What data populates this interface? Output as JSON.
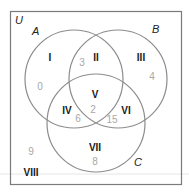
{
  "diagram": {
    "type": "venn-3-set",
    "universe_label": "U",
    "sets": [
      {
        "label": "A"
      },
      {
        "label": "B"
      },
      {
        "label": "C"
      }
    ],
    "regions": [
      {
        "id": "I",
        "label": "I",
        "count": "0"
      },
      {
        "id": "II",
        "label": "II",
        "count": "3"
      },
      {
        "id": "III",
        "label": "III",
        "count": "4"
      },
      {
        "id": "IV",
        "label": "IV",
        "count": "6"
      },
      {
        "id": "V",
        "label": "V",
        "count": "2"
      },
      {
        "id": "VI",
        "label": "VI",
        "count": "15"
      },
      {
        "id": "VII",
        "label": "VII",
        "count": "8"
      },
      {
        "id": "VIII",
        "label": "VIII",
        "count": "9"
      }
    ],
    "colors": {
      "circle_stroke": "#8c8c8c",
      "frame_stroke": "#7a7a7a",
      "count_text": "#a8a8a8",
      "region_label_text": "#1a1a1a"
    }
  }
}
